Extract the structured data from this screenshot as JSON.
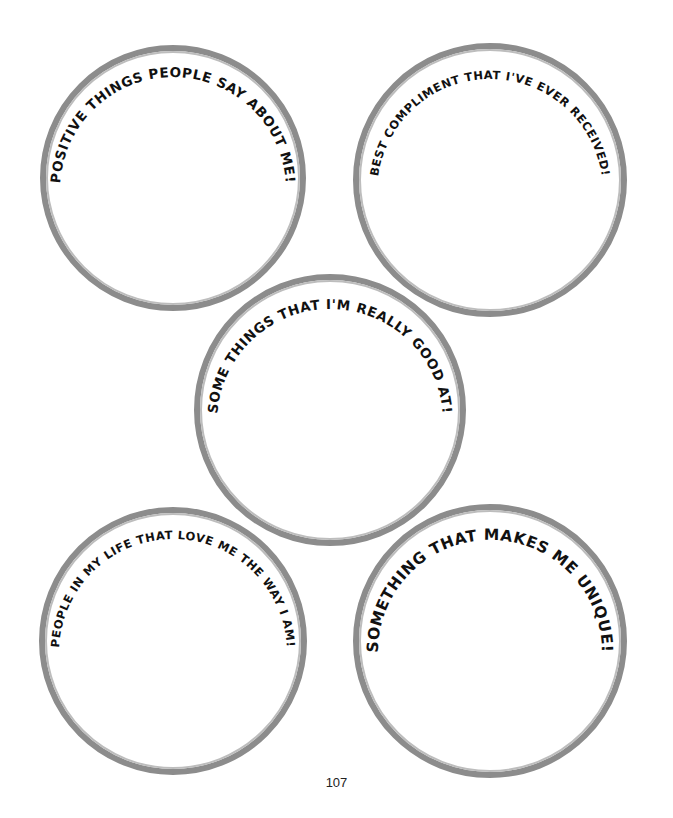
{
  "page": {
    "page_number": "107",
    "ring_color": "#8c8c8c",
    "text_color": "#111111"
  },
  "circles": [
    {
      "label": "POSITIVE THINGS PEOPLE SAY ABOUT ME!",
      "answer": ""
    },
    {
      "label": "BEST COMPLIMENT THAT I'VE EVER RECEIVED!",
      "answer": ""
    },
    {
      "label": "SOME THINGS THAT I'M REALLY GOOD AT!",
      "answer": ""
    },
    {
      "label": "PEOPLE IN MY LIFE THAT LOVE ME THE WAY I AM!",
      "answer": ""
    },
    {
      "label": "SOMETHING THAT MAKES ME UNIQUE!",
      "answer": ""
    }
  ]
}
